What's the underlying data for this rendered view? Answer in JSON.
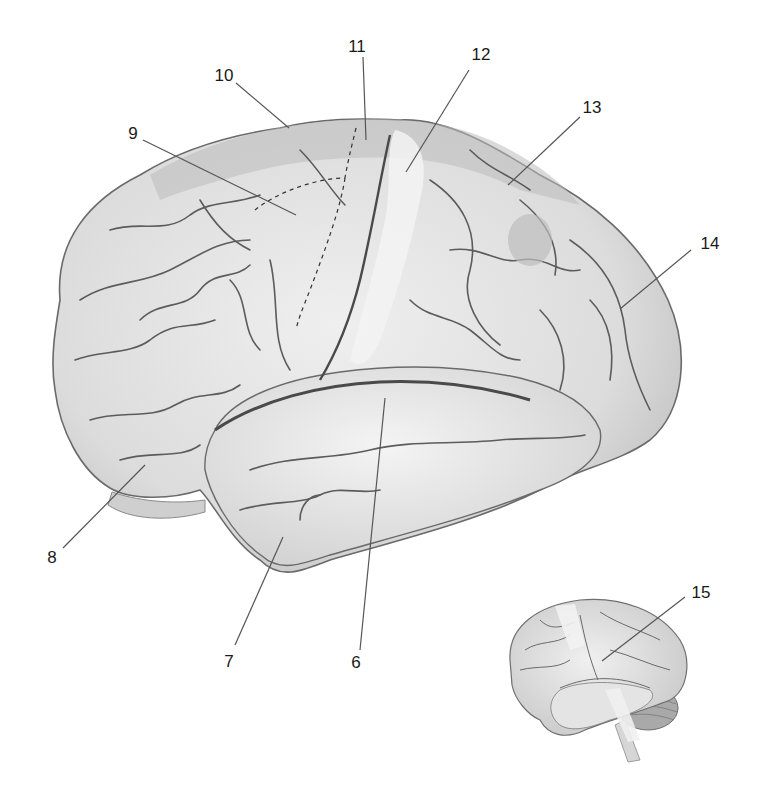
{
  "figure": {
    "colors": {
      "background": "#ffffff",
      "brain_light": "#e6e6e6",
      "brain_mid": "#c9c9c9",
      "brain_dark": "#9a9a9a",
      "sulcus": "#5a5a5a",
      "leader_line": "#555555",
      "label_text": "#1a1a1a"
    },
    "callouts": [
      {
        "id": "6",
        "label": "6",
        "text_x": 356,
        "text_y": 662,
        "line": [
          360,
          650,
          385,
          398
        ]
      },
      {
        "id": "7",
        "label": "7",
        "text_x": 229,
        "text_y": 661,
        "line": [
          235,
          645,
          283,
          537
        ]
      },
      {
        "id": "8",
        "label": "8",
        "text_x": 52,
        "text_y": 557,
        "line": [
          63,
          548,
          145,
          465
        ]
      },
      {
        "id": "9",
        "label": "9",
        "text_x": 133,
        "text_y": 133,
        "line": [
          143,
          140,
          296,
          215
        ]
      },
      {
        "id": "10",
        "label": "10",
        "text_x": 224,
        "text_y": 75,
        "line": [
          236,
          83,
          289,
          128
        ]
      },
      {
        "id": "11",
        "label": "11",
        "text_x": 357,
        "text_y": 46,
        "line": [
          363,
          57,
          366,
          140
        ]
      },
      {
        "id": "12",
        "label": "12",
        "text_x": 481,
        "text_y": 54,
        "line": [
          469,
          70,
          406,
          172
        ]
      },
      {
        "id": "13",
        "label": "13",
        "text_x": 592,
        "text_y": 107,
        "line": [
          580,
          117,
          508,
          185
        ]
      },
      {
        "id": "14",
        "label": "14",
        "text_x": 710,
        "text_y": 243,
        "line": [
          691,
          250,
          620,
          309
        ]
      },
      {
        "id": "15",
        "label": "15",
        "text_x": 701,
        "text_y": 592,
        "line": [
          685,
          597,
          602,
          661
        ]
      }
    ],
    "inset": {
      "description": "Small whole-brain lateral view with cerebellum and brainstem",
      "x": 505,
      "y": 595,
      "width": 190,
      "height": 170
    }
  }
}
